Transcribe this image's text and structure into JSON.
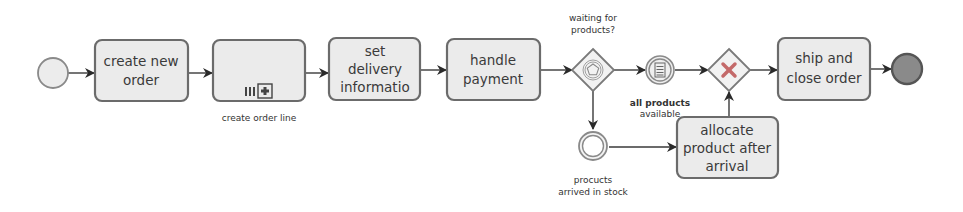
{
  "diagram": {
    "type": "BPMN process",
    "start_event": {
      "label": ""
    },
    "tasks": {
      "create_new_order": {
        "line1": "create new",
        "line2": "order"
      },
      "create_order_line": {
        "label": "create order line",
        "marker": "multi-instance subprocess"
      },
      "set_delivery": {
        "line1": "set",
        "line2": "delivery",
        "line3": "informatio"
      },
      "handle_payment": {
        "line1": "handle",
        "line2": "payment"
      },
      "allocate_product": {
        "line1": "allocate",
        "line2": "product after",
        "line3": "arrival"
      },
      "ship_and_close": {
        "line1": "ship and",
        "line2": "close order"
      }
    },
    "gateways": {
      "event_based": {
        "line1": "waiting for",
        "line2": "products?"
      },
      "exclusive": {
        "label": ""
      }
    },
    "events": {
      "all_products_available": {
        "line1": "all products",
        "line2": "available"
      },
      "products_arrived": {
        "line1": "procucts",
        "line2": "arrived in stock"
      }
    },
    "end_event": {
      "label": ""
    },
    "colors": {
      "task_fill": "#ebebeb",
      "stroke": "#6b6b6b",
      "end_fill": "#8a8a8a",
      "x_marker": "#c46a6a"
    }
  }
}
